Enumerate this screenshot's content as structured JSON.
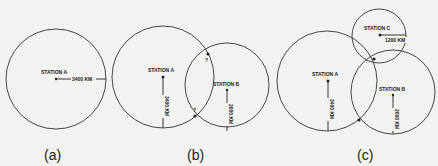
{
  "panels": [
    {
      "caption": "(a)",
      "stations": [
        {
          "name": "STATION A",
          "distance": "3400 KM"
        }
      ]
    },
    {
      "caption": "(b)",
      "stations": [
        {
          "name": "STATION A",
          "distance": "3400 KM"
        },
        {
          "name": "STATION B",
          "distance": "2000 KM"
        }
      ],
      "intersection_marks": [
        "?",
        "?"
      ]
    },
    {
      "caption": "(c)",
      "stations": [
        {
          "name": "STATION A",
          "distance": "3400 KM"
        },
        {
          "name": "STATION B",
          "distance": "2000 KM"
        },
        {
          "name": "STATION C",
          "distance": "1200 KM"
        }
      ]
    }
  ],
  "colors": {
    "background": "#f2f2f0",
    "line": "#333333"
  }
}
